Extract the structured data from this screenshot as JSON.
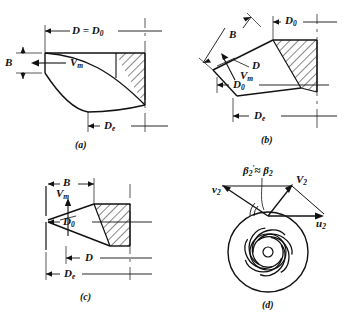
{
  "figure": {
    "line_color": "#111111",
    "hatch_color": "#111111",
    "background": "#ffffff"
  },
  "panels": [
    {
      "id": "a",
      "caption": "(a)",
      "type": "radial-flow-impeller-section",
      "labels": {
        "top_dimension": "D = D",
        "top_dimension_sub": "0",
        "width_dimension": "B",
        "velocity": "V",
        "velocity_sub": "m",
        "eye_dimension": "D",
        "eye_dimension_sub": "e"
      }
    },
    {
      "id": "b",
      "caption": "(b)",
      "type": "mixed-flow-impeller-section",
      "labels": {
        "hub_dimension": "D",
        "hub_dimension_sub": "0",
        "width_dimension": "B",
        "mid_dimension": "D",
        "velocity": "V",
        "velocity_sub": "m",
        "inner_dimension": "D",
        "inner_dimension_sub": "0",
        "eye_dimension": "D",
        "eye_dimension_sub": "e"
      }
    },
    {
      "id": "c",
      "caption": "(c)",
      "type": "axial-flow-impeller-section",
      "labels": {
        "width_dimension": "B",
        "velocity": "V",
        "velocity_sub": "m",
        "hub_dimension": "D",
        "hub_dimension_sub": "0",
        "mid_dimension": "D",
        "eye_dimension": "D",
        "eye_dimension_sub": "e"
      }
    },
    {
      "id": "d",
      "caption": "(d)",
      "type": "impeller-front-view-with-velocity-triangle",
      "vane_count": 7,
      "labels": {
        "blade_angle": "β",
        "blade_angle_sub": "2",
        "blade_angle_prime": "′",
        "blade_angle_approx": "≈",
        "blade_angle_second": "β",
        "blade_angle_second_sub": "2",
        "relative_velocity": "v",
        "relative_velocity_sub": "2",
        "absolute_velocity": "V",
        "absolute_velocity_sub": "2",
        "tangential_velocity": "u",
        "tangential_velocity_sub": "2"
      }
    }
  ]
}
